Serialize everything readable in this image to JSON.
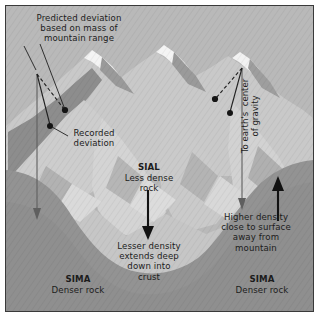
{
  "diagram": {
    "title_concept": "isostasy-plumb-line-deflection",
    "frame": {
      "border_color": "#3a3a3a",
      "sky_color": "#b9b9b9"
    },
    "colors": {
      "sky": "#b9b9b9",
      "sial_light": "#cfcfcf",
      "sial_mid": "#bdbdbd",
      "mountain_shadow": "#8f8f8f",
      "snow": "#f2f2f2",
      "sima_dark": "#9a9a9a",
      "line_dark": "#2a2a2a",
      "plumb_line": "#6a6a6a",
      "text": "#1c1c1c"
    },
    "labels": {
      "predicted_deviation": "Predicted deviation\nbased on mass of\nmountain range",
      "recorded_deviation": "Recorded\ndeviation",
      "sial_title": "SIAL",
      "sial_body": "Less dense\nrock",
      "lesser_density": "Lesser density\nextends deep\ndown into\ncrust",
      "to_earths_center": "To earth's  center\nof gravity",
      "higher_density": "Higher density\nclose to surface\naway from\nmountain",
      "sima_left_title": "SIMA",
      "sima_left_body": "Denser rock",
      "sima_right_title": "SIMA",
      "sima_right_body": "Denser rock"
    },
    "annotations": {
      "left_plumb_arrow": "down-arrow",
      "right_plumb_arrow": "down-arrow",
      "sial_down_arrow": "down-arrow",
      "sima_up_arrow": "up-arrow",
      "predicted_bob": "pendulum-bob-dashed",
      "recorded_bob": "pendulum-bob-solid"
    }
  }
}
